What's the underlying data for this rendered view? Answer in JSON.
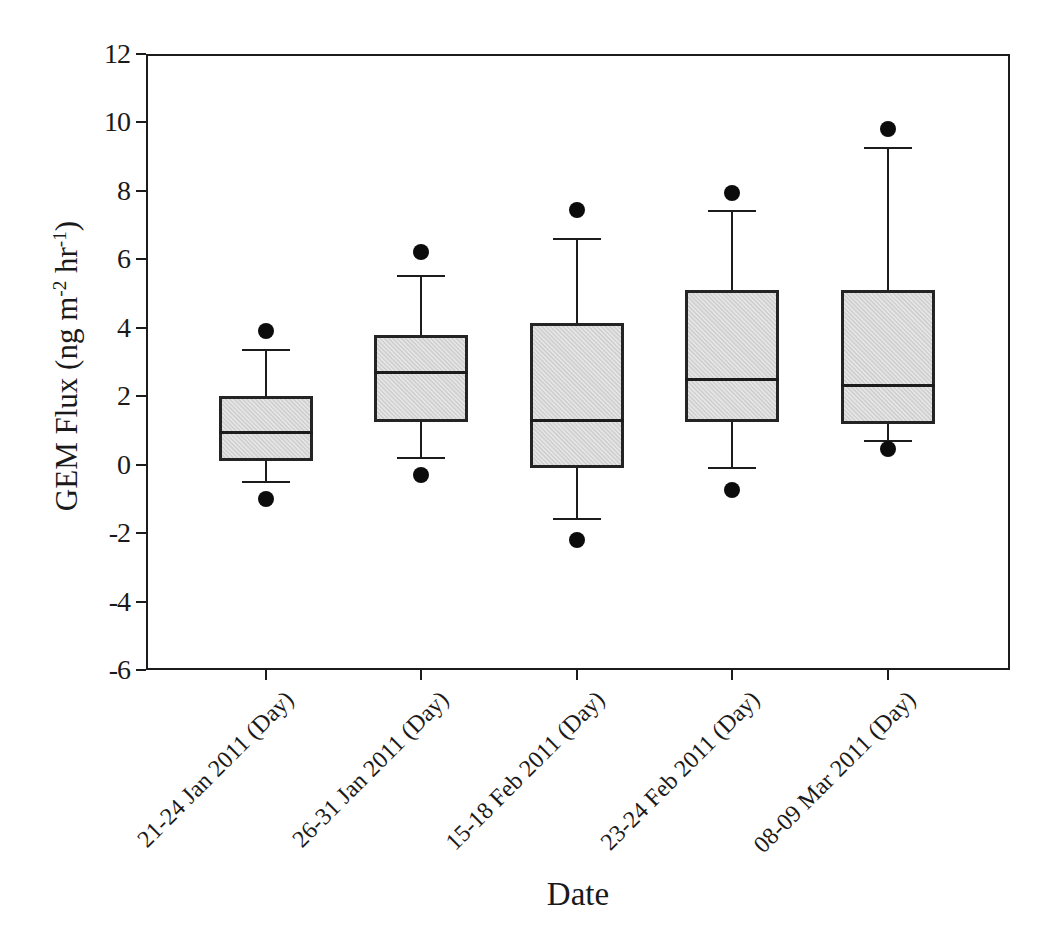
{
  "chart_data": {
    "type": "box",
    "title": "",
    "xlabel": "Date",
    "ylabel": "GEM Flux (ng m-2 hr-1)",
    "ylabel_parts": {
      "prefix": "GEM Flux (ng m",
      "sup1": "-2",
      "mid": " hr",
      "sup2": "-1",
      "suffix": ")"
    },
    "ylim": [
      -6,
      12
    ],
    "yticks": [
      12,
      10,
      8,
      6,
      4,
      2,
      0,
      -2,
      -4,
      -6
    ],
    "grid": false,
    "legend": "none",
    "categories": [
      "21-24 Jan 2011 (Day)",
      "26-31 Jan 2011 (Day)",
      "15-18 Feb 2011 (Day)",
      "23-24 Feb 2011 (Day)",
      "08-09 Mar 2011 (Day)"
    ],
    "series": [
      {
        "label": "21-24 Jan 2011 (Day)",
        "whisker_low": -0.5,
        "q1": 0.1,
        "median": 0.95,
        "q3": 2.0,
        "whisker_high": 3.35,
        "outliers": [
          3.9,
          -1.0
        ]
      },
      {
        "label": "26-31 Jan 2011 (Day)",
        "whisker_low": 0.2,
        "q1": 1.25,
        "median": 2.7,
        "q3": 3.8,
        "whisker_high": 5.5,
        "outliers": [
          6.2,
          -0.3
        ]
      },
      {
        "label": "15-18 Feb 2011 (Day)",
        "whisker_low": -1.6,
        "q1": -0.1,
        "median": 1.3,
        "q3": 4.15,
        "whisker_high": 6.6,
        "outliers": [
          7.45,
          -2.2
        ]
      },
      {
        "label": "23-24 Feb 2011 (Day)",
        "whisker_low": -0.1,
        "q1": 1.25,
        "median": 2.5,
        "q3": 5.1,
        "whisker_high": 7.4,
        "outliers": [
          7.95,
          -0.75
        ]
      },
      {
        "label": "08-09 Mar 2011 (Day)",
        "whisker_low": 0.7,
        "q1": 1.2,
        "median": 2.3,
        "q3": 5.1,
        "whisker_high": 9.25,
        "outliers": [
          9.8,
          0.45
        ]
      }
    ],
    "colors": {
      "box_fill": "#d7d7d7",
      "line": "#1c1c1c",
      "outlier_dot": "#0c0c0c",
      "background": "#ffffff"
    }
  }
}
